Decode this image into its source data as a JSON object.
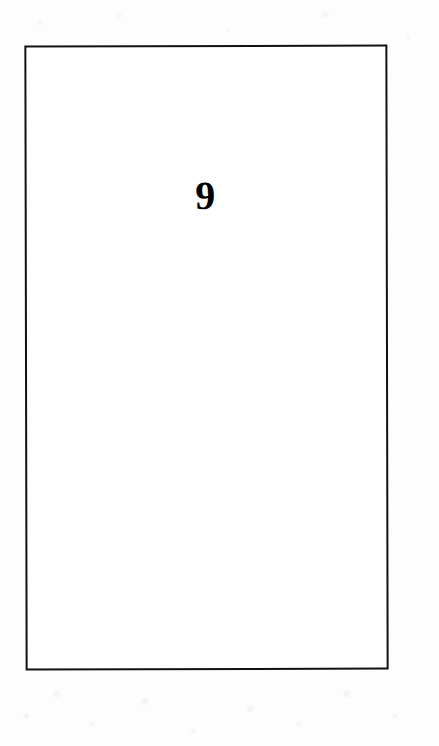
{
  "document": {
    "kind": "scanned-book-page",
    "page_number": "9",
    "body_text": "",
    "frame": {
      "visible": true,
      "stroke_color": "#111111",
      "fill_color": "#ffffff"
    },
    "background_color": "#fdfdfd",
    "text_color": "#000000"
  }
}
